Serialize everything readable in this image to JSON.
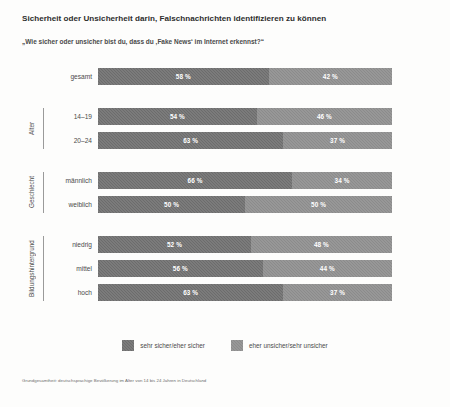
{
  "chart_data": {
    "type": "bar",
    "orientation": "horizontal",
    "stacked": true,
    "normalized_percent": true,
    "title": "Sicherheit oder Unsicherheit darin, Falschnachrichten identifizieren zu können",
    "subtitle": "„Wie sicher oder unsicher bist du, dass du ‚Fake News‘ im Internet erkennst?“",
    "xlabel": "",
    "ylabel": "",
    "xlim": [
      0,
      100
    ],
    "grid": false,
    "legend_position": "bottom-center",
    "legend": [
      {
        "name": "sehr sicher/eher sicher",
        "color": "#6c6c6c"
      },
      {
        "name": "eher unsicher/sehr unsicher",
        "color": "#8b8b8b"
      }
    ],
    "series": [
      {
        "name": "sehr sicher/eher sicher",
        "color": "#6c6c6c",
        "values": [
          58,
          54,
          63,
          66,
          50,
          52,
          56,
          63
        ]
      },
      {
        "name": "eher unsicher/sehr unsicher",
        "color": "#8b8b8b",
        "values": [
          42,
          46,
          37,
          34,
          50,
          48,
          44,
          37
        ]
      }
    ],
    "categories": [
      "gesamt",
      "14–19",
      "20–24",
      "männlich",
      "weiblich",
      "niedrig",
      "mittel",
      "hoch"
    ],
    "groups": [
      {
        "group_label": "",
        "rows": [
          {
            "label": "gesamt",
            "left_value": 58,
            "right_value": 42,
            "left_text": "58 %",
            "right_text": "42 %"
          }
        ]
      },
      {
        "group_label": "Alter",
        "rows": [
          {
            "label": "14–19",
            "left_value": 54,
            "right_value": 46,
            "left_text": "54 %",
            "right_text": "46 %"
          },
          {
            "label": "20–24",
            "left_value": 63,
            "right_value": 37,
            "left_text": "63 %",
            "right_text": "37 %"
          }
        ]
      },
      {
        "group_label": "Geschlecht",
        "rows": [
          {
            "label": "männlich",
            "left_value": 66,
            "right_value": 34,
            "left_text": "66 %",
            "right_text": "34 %"
          },
          {
            "label": "weiblich",
            "left_value": 50,
            "right_value": 50,
            "left_text": "50 %",
            "right_text": "50 %"
          }
        ]
      },
      {
        "group_label": "Bildungshintergrund",
        "rows": [
          {
            "label": "niedrig",
            "left_value": 52,
            "right_value": 48,
            "left_text": "52 %",
            "right_text": "48 %"
          },
          {
            "label": "mittel",
            "left_value": 56,
            "right_value": 44,
            "left_text": "56 %",
            "right_text": "44 %"
          },
          {
            "label": "hoch",
            "left_value": 63,
            "right_value": 37,
            "left_text": "63 %",
            "right_text": "37 %"
          }
        ]
      }
    ],
    "footnote": "Grundgesamtheit: deutschsprachige Bevölkerung im Alter von 14 bis 24 Jahren in Deutschland"
  }
}
